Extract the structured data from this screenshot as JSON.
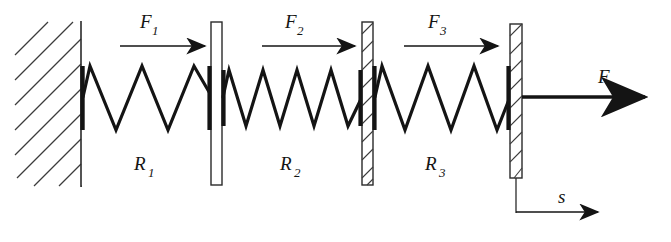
{
  "figure": {
    "type": "mechanical-schematic",
    "width": 671,
    "height": 242,
    "background_color": "#ffffff",
    "ink_color": "#141414",
    "hatch_color": "#3c3c3c"
  },
  "wall": {
    "name": "fixed-support-wall",
    "hatch_direction": "lower-left-to-upper-right",
    "boundary_x": 81,
    "top_y": 22,
    "bottom_y": 186,
    "hatch_count": 9
  },
  "springs": [
    {
      "id": "spring-1",
      "label": "R",
      "subscript": "1",
      "label_full": "R1",
      "coils": 2.5,
      "x_start": 82,
      "x_end": 213,
      "label_x": 146,
      "label_y": 170
    },
    {
      "id": "spring-2",
      "label": "R",
      "subscript": "2",
      "label_full": "R2",
      "coils": 4,
      "x_start": 222,
      "x_end": 363,
      "label_x": 292,
      "label_y": 170
    },
    {
      "id": "spring-3",
      "label": "R",
      "subscript": "3",
      "label_full": "R3",
      "coils": 3,
      "x_start": 373,
      "x_end": 511,
      "label_x": 437,
      "label_y": 170
    }
  ],
  "plates": [
    {
      "id": "plate-1",
      "x": 211,
      "y": 22,
      "width": 11,
      "height": 163
    },
    {
      "id": "plate-2",
      "x": 362,
      "y": 22,
      "width": 11,
      "height": 163
    },
    {
      "id": "plate-3",
      "x": 510,
      "y": 24,
      "width": 12,
      "height": 154
    }
  ],
  "force_arrows": [
    {
      "id": "force-arrow-1",
      "label": "F",
      "subscript": "1",
      "label_full": "F1",
      "label_x": 140,
      "label_y": 28,
      "line_y": 46,
      "x_start": 120,
      "x_end": 205
    },
    {
      "id": "force-arrow-2",
      "label": "F",
      "subscript": "2",
      "label_full": "F2",
      "label_x": 285,
      "label_y": 28,
      "line_y": 46,
      "x_start": 262,
      "x_end": 355
    },
    {
      "id": "force-arrow-3",
      "label": "F",
      "subscript": "3",
      "label_full": "F3",
      "label_x": 428,
      "label_y": 28,
      "line_y": 46,
      "x_start": 404,
      "x_end": 498
    }
  ],
  "applied_force": {
    "id": "applied-force-F",
    "label": "F",
    "label_x": 598,
    "label_y": 83,
    "line_y": 97,
    "x_start": 522,
    "x_end": 645
  },
  "displacement": {
    "id": "displacement-s",
    "label": "s",
    "label_x": 560,
    "label_y": 203,
    "extension_x": 516,
    "extension_y_top": 178,
    "extension_y_bottom": 212,
    "line_y": 212,
    "x_start": 516,
    "x_end": 598
  }
}
